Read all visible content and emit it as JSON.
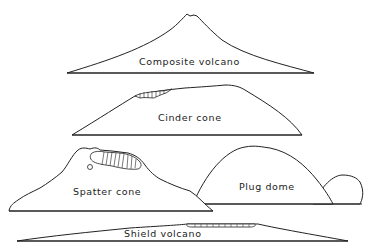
{
  "diagram": {
    "type": "volcano-types-profile-sketches",
    "line_color": "#222222",
    "background": "#ffffff",
    "volcanoes": [
      {
        "id": "composite",
        "label": "Composite volcano"
      },
      {
        "id": "cinder",
        "label": "Cinder cone"
      },
      {
        "id": "spatter",
        "label": "Spatter cone"
      },
      {
        "id": "plug",
        "label": "Plug dome"
      },
      {
        "id": "shield",
        "label": "Shield volcano"
      }
    ]
  }
}
